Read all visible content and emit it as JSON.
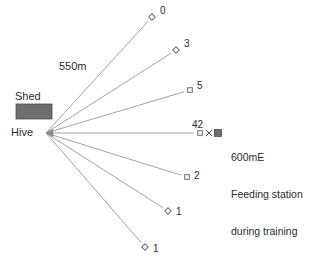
{
  "figure": {
    "hive_label": "Hive",
    "shed_label": "Shed",
    "distance_label": "550m",
    "feeding_station_lines": [
      "600mE",
      "Feeding station",
      "during training"
    ],
    "center_count_label": "42",
    "colors": {
      "line": "#8a8a8a",
      "text": "#2b2b2b",
      "shed_fill": "#6e6e6e",
      "station_fill": "#6e6e6e",
      "marker_stroke": "#6e6e6e"
    }
  },
  "chart_data": {
    "type": "scatter",
    "title": "",
    "subtitle": "",
    "xlabel": "",
    "ylabel": "",
    "origin": {
      "name": "Hive",
      "x": 46,
      "y": 133
    },
    "radius_label": "550m",
    "grid": false,
    "legend": "none",
    "rays": [
      {
        "id": "ray-0",
        "count": "0",
        "x": 152,
        "y": 17,
        "marker": "diamond",
        "label_dx": 8,
        "label_dy": -12
      },
      {
        "id": "ray-3",
        "count": "3",
        "x": 176,
        "y": 50,
        "marker": "diamond",
        "label_dx": 8,
        "label_dy": -12
      },
      {
        "id": "ray-5",
        "count": "5",
        "x": 190,
        "y": 90,
        "marker": "square",
        "label_dx": 7,
        "label_dy": -10
      },
      {
        "id": "ray-42",
        "count": "42",
        "x": 200,
        "y": 133,
        "marker": "square",
        "label_dx": -8,
        "label_dy": -21
      },
      {
        "id": "ray-2",
        "count": "2",
        "x": 187,
        "y": 177,
        "marker": "square",
        "label_dx": 7,
        "label_dy": -7
      },
      {
        "id": "ray-1a",
        "count": "1",
        "x": 168,
        "y": 211,
        "marker": "diamond",
        "label_dx": 8,
        "label_dy": -5
      },
      {
        "id": "ray-1b",
        "count": "1",
        "x": 145,
        "y": 247,
        "marker": "diamond",
        "label_dx": 8,
        "label_dy": -4
      }
    ],
    "shed": {
      "label": "Shed",
      "x": 16,
      "y": 104,
      "width": 36,
      "height": 15
    },
    "feeding_station": {
      "x": 218,
      "y": 133,
      "size": 7,
      "cross_x": 209,
      "cross_y": 133
    }
  }
}
